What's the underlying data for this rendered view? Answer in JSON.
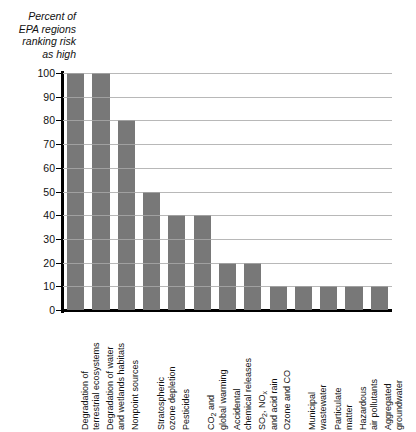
{
  "chart_data": {
    "type": "bar",
    "title": "",
    "ylabel": "Percent of\nEPA regions\nranking risk\nas high",
    "xlabel": "",
    "ylim": [
      0,
      100
    ],
    "yticks": [
      0,
      10,
      20,
      30,
      40,
      50,
      60,
      70,
      80,
      90,
      100
    ],
    "ytick_labels": [
      "0",
      "10",
      "20",
      "30",
      "40",
      "50",
      "60",
      "70",
      "80",
      "90",
      "100"
    ],
    "grid": true,
    "legend": "none",
    "bar_color": "#787878",
    "categories": [
      "Degradation of\nterrestrial ecosystems",
      "Degradation of water\nand wetlands habitats",
      "Nonpoint sources",
      "Stratospheric\nozone depletion",
      "Pesticides",
      "CO2 and\nglobal warming",
      "Accidental\nchemical releases",
      "SO2, NOx\nand acid rain",
      "Ozone and CO",
      "Municipal\nwastewater",
      "Particulate\nmatter",
      "Hazardous\nair pollutants",
      "Aggregated\ngroundwater"
    ],
    "values": [
      100,
      100,
      80,
      50,
      40,
      40,
      20,
      20,
      10,
      10,
      10,
      10,
      10
    ]
  }
}
